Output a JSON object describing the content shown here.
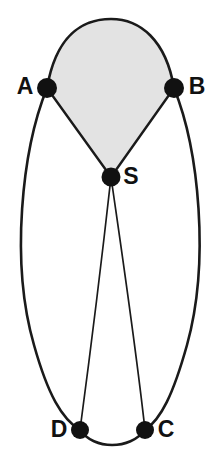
{
  "figure": {
    "background_color": "#ffffff",
    "width": 219,
    "height": 465
  },
  "style": {
    "edge_color": "#1a1a1a",
    "node_fill": "#111111",
    "label_color": "#111111",
    "shaded_face_fill": "#e3e3e3",
    "shaded_face_stroke": "#1a1a1a",
    "outer_edge_width": 2.6,
    "inner_edge_width": 1.6,
    "node_radius": 9.5,
    "label_font_size": 23
  },
  "nodes": [
    {
      "id": "A",
      "label": "A",
      "x": 47,
      "y": 88,
      "radius": 10,
      "label_x": 25,
      "label_y": 88,
      "label_anchor": "middle"
    },
    {
      "id": "B",
      "label": "B",
      "x": 174,
      "y": 88,
      "radius": 10,
      "label_x": 197,
      "label_y": 88,
      "label_anchor": "middle"
    },
    {
      "id": "S",
      "label": "S",
      "x": 111,
      "y": 177,
      "radius": 9.5,
      "label_x": 131,
      "label_y": 178,
      "label_anchor": "middle"
    },
    {
      "id": "D",
      "label": "D",
      "x": 80,
      "y": 430,
      "radius": 9,
      "label_x": 59,
      "label_y": 431,
      "label_anchor": "middle"
    },
    {
      "id": "C",
      "label": "C",
      "x": 145,
      "y": 430,
      "radius": 9,
      "label_x": 166,
      "label_y": 431,
      "label_anchor": "middle"
    }
  ],
  "edges": [
    {
      "id": "A-B",
      "from": "A",
      "to": "B",
      "kind": "arc",
      "weight": "outer",
      "path": "M 47 88 C 56 36 82 19 111 19 C 140 19 166 40 174 88"
    },
    {
      "id": "A-S",
      "from": "A",
      "to": "S",
      "kind": "straight",
      "weight": "outer",
      "path": "M 47 88 L 111 177"
    },
    {
      "id": "B-S",
      "from": "B",
      "to": "S",
      "kind": "straight",
      "weight": "outer",
      "path": "M 174 88 L 111 177"
    },
    {
      "id": "A-D",
      "from": "A",
      "to": "D",
      "kind": "arc",
      "weight": "outer",
      "path": "M 47 88 C 22 150 10 262 34 345 C 48 395 62 419 80 430"
    },
    {
      "id": "B-C",
      "from": "B",
      "to": "C",
      "kind": "arc",
      "weight": "outer",
      "path": "M 174 88 C 199 150 210 262 187 345 C 173 395 161 419 145 430"
    },
    {
      "id": "S-D",
      "from": "S",
      "to": "D",
      "kind": "arc",
      "weight": "inner",
      "path": "M 111 177 C 104 240 92 340 80 430"
    },
    {
      "id": "S-C",
      "from": "S",
      "to": "C",
      "kind": "arc",
      "weight": "inner",
      "path": "M 111 177 C 120 240 135 340 145 430"
    },
    {
      "id": "D-C",
      "from": "D",
      "to": "C",
      "kind": "arc",
      "weight": "outer",
      "path": "M 80 430 C 94 450 130 450 145 430"
    }
  ],
  "faces": [
    {
      "id": "ASB",
      "label": "shaded-face-ASB",
      "vertices": [
        "A",
        "S",
        "B"
      ],
      "fill": "#e3e3e3",
      "path": "M 47 88 C 56 36 82 19 111 19 C 140 19 166 40 174 88 L 111 177 Z"
    }
  ]
}
